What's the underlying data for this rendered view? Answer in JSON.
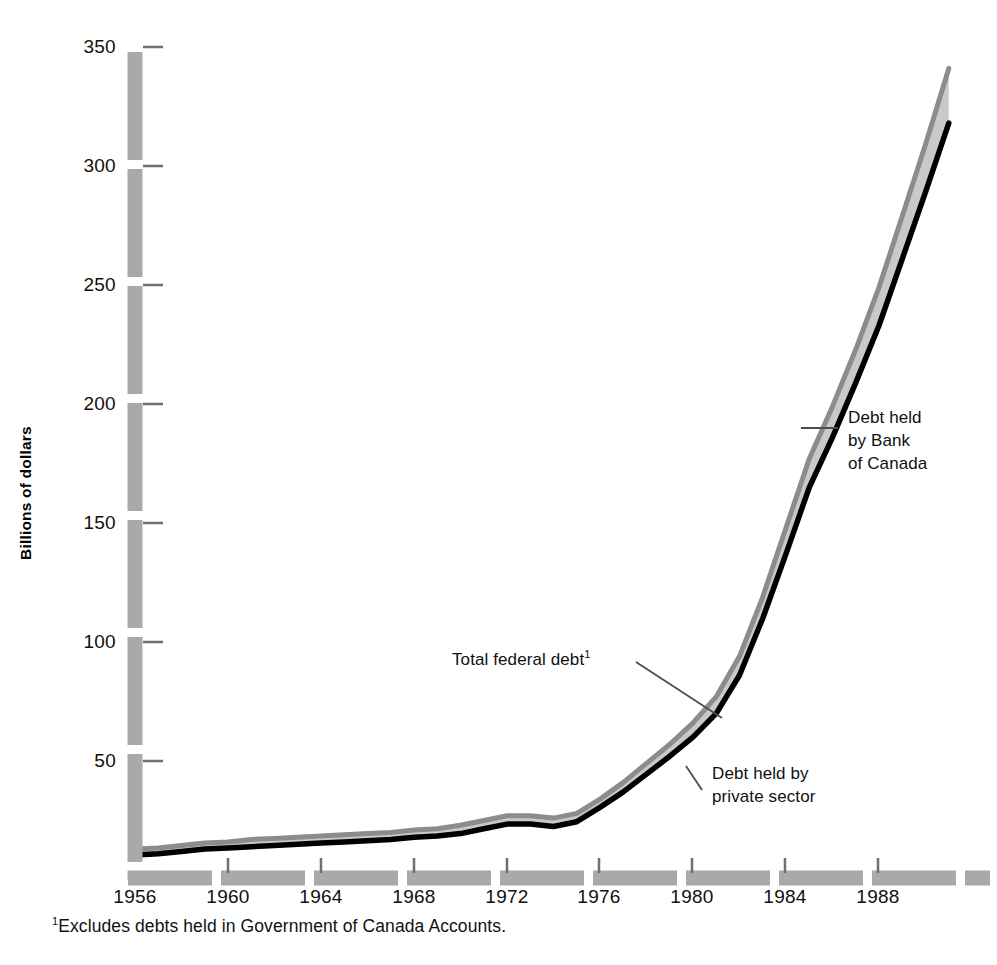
{
  "chart_data": {
    "type": "area",
    "title": "",
    "subtitle": "",
    "xlabel": "",
    "ylabel": "Billions of dollars",
    "xlim": [
      1955,
      1991.5
    ],
    "ylim": [
      0,
      350
    ],
    "grid": false,
    "legend_position": "inline-annotations",
    "y_ticks": [
      50,
      100,
      150,
      200,
      250,
      300,
      350
    ],
    "y_tick_labels": [
      "50",
      "100",
      "150",
      "200",
      "250",
      "300",
      "350"
    ],
    "x_ticks": [
      1956,
      1960,
      1964,
      1968,
      1972,
      1976,
      1980,
      1984,
      1988
    ],
    "x_tick_labels": [
      "1956",
      "1960",
      "1964",
      "1968",
      "1972",
      "1976",
      "1980",
      "1984",
      "1988"
    ],
    "x": [
      1956,
      1957,
      1958,
      1959,
      1960,
      1961,
      1962,
      1963,
      1964,
      1965,
      1966,
      1967,
      1968,
      1969,
      1970,
      1971,
      1972,
      1973,
      1974,
      1975,
      1976,
      1977,
      1978,
      1979,
      1980,
      1981,
      1982,
      1983,
      1984,
      1985,
      1986,
      1987,
      1988,
      1989,
      1990,
      1991
    ],
    "series": [
      {
        "name": "Total federal debt",
        "note": "Excludes debts held in Government of Canada Accounts.",
        "color": "#8c8c8c",
        "values": [
          13,
          13.5,
          14.5,
          15.5,
          16,
          17,
          17.5,
          18,
          18.5,
          19,
          19.5,
          20,
          21,
          21.5,
          23,
          25,
          27,
          27,
          26,
          28,
          34,
          41,
          49,
          57,
          66,
          77,
          94,
          119,
          148,
          177,
          199,
          223,
          249,
          279,
          309,
          341
        ]
      },
      {
        "name": "Debt held by private sector",
        "color": "#000000",
        "values": [
          10.5,
          11,
          12,
          13,
          13.5,
          14,
          14.5,
          15,
          15.5,
          16,
          16.5,
          17,
          18,
          18.5,
          19.5,
          21.5,
          23.5,
          23.5,
          22.5,
          24.5,
          30.5,
          37,
          44.5,
          52,
          60,
          70,
          86,
          110,
          137,
          165,
          186,
          209,
          233,
          261,
          289,
          318
        ]
      }
    ],
    "band": {
      "name": "Debt held by Bank of Canada",
      "description": "Shaded area between total federal debt and debt held by private sector",
      "color": "#c9c9c9"
    },
    "annotations": [
      {
        "name": "total-federal-debt",
        "text": "Total federal debt",
        "superscript": "1"
      },
      {
        "name": "debt-held-by-private-sector",
        "text": "Debt held by\nprivate sector"
      },
      {
        "name": "debt-held-by-bank-of-canada",
        "text": "Debt held\nby Bank\nof Canada"
      }
    ],
    "footnote": {
      "marker": "1",
      "text": "Excludes debts held in Government of Canada Accounts."
    },
    "axis_style": {
      "axis_bar_color": "#a9a9a9",
      "tick_color": "#6f6f6f",
      "note": "Axes drawn as thick dashed grey bars"
    }
  }
}
